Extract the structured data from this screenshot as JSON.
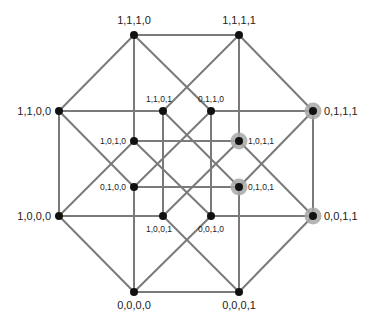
{
  "diagram": {
    "title": "",
    "type": "4-dimensional hypercube (tesseract) projection",
    "colors": {
      "edge": "#7a7a7a",
      "node": "#111111",
      "highlight": "#a8a8a8",
      "label": "#222222"
    },
    "nodes": [
      {
        "id": "1110",
        "label": "1,1,1,0",
        "x": 134,
        "y": 35,
        "kind": "outer",
        "highlight": false,
        "lx": 134,
        "ly": 24,
        "anchor": "middle"
      },
      {
        "id": "1111",
        "label": "1,1,1,1",
        "x": 239,
        "y": 35,
        "kind": "outer",
        "highlight": false,
        "lx": 239,
        "ly": 24,
        "anchor": "middle"
      },
      {
        "id": "1100",
        "label": "1,1,0,0",
        "x": 59,
        "y": 111,
        "kind": "outer",
        "highlight": false,
        "lx": 51,
        "ly": 115,
        "anchor": "end"
      },
      {
        "id": "0111",
        "label": "0,1,1,1",
        "x": 313,
        "y": 111,
        "kind": "outer",
        "highlight": true,
        "lx": 324,
        "ly": 115,
        "anchor": "start"
      },
      {
        "id": "1000",
        "label": "1,0,0,0",
        "x": 59,
        "y": 216,
        "kind": "outer",
        "highlight": false,
        "lx": 51,
        "ly": 220,
        "anchor": "end"
      },
      {
        "id": "0011",
        "label": "0,0,1,1",
        "x": 313,
        "y": 216,
        "kind": "outer",
        "highlight": true,
        "lx": 324,
        "ly": 220,
        "anchor": "start"
      },
      {
        "id": "0000",
        "label": "0,0,0,0",
        "x": 134,
        "y": 292,
        "kind": "outer",
        "highlight": false,
        "lx": 134,
        "ly": 309,
        "anchor": "middle"
      },
      {
        "id": "0001",
        "label": "0,0,0,1",
        "x": 239,
        "y": 292,
        "kind": "outer",
        "highlight": false,
        "lx": 239,
        "ly": 309,
        "anchor": "middle"
      },
      {
        "id": "1101",
        "label": "1,1,0,1",
        "x": 163,
        "y": 111,
        "kind": "inner",
        "highlight": false,
        "lx": 159,
        "ly": 102,
        "anchor": "middle"
      },
      {
        "id": "0110",
        "label": "0,1,1,0",
        "x": 211,
        "y": 111,
        "kind": "inner",
        "highlight": false,
        "lx": 211,
        "ly": 102,
        "anchor": "middle"
      },
      {
        "id": "1010",
        "label": "1,0,1,0",
        "x": 134,
        "y": 141,
        "kind": "inner",
        "highlight": false,
        "lx": 126,
        "ly": 144,
        "anchor": "end"
      },
      {
        "id": "1011",
        "label": "1,0,1,1",
        "x": 239,
        "y": 141,
        "kind": "inner",
        "highlight": true,
        "lx": 248,
        "ly": 144,
        "anchor": "start"
      },
      {
        "id": "0100",
        "label": "0,1,0,0",
        "x": 134,
        "y": 187,
        "kind": "inner",
        "highlight": false,
        "lx": 126,
        "ly": 190,
        "anchor": "end"
      },
      {
        "id": "0101",
        "label": "0,1,0,1",
        "x": 239,
        "y": 187,
        "kind": "inner",
        "highlight": true,
        "lx": 248,
        "ly": 190,
        "anchor": "start"
      },
      {
        "id": "1001",
        "label": "1,0,0,1",
        "x": 163,
        "y": 216,
        "kind": "inner",
        "highlight": false,
        "lx": 159,
        "ly": 232,
        "anchor": "middle"
      },
      {
        "id": "0010",
        "label": "0,0,1,0",
        "x": 211,
        "y": 216,
        "kind": "inner",
        "highlight": false,
        "lx": 211,
        "ly": 232,
        "anchor": "middle"
      }
    ]
  }
}
